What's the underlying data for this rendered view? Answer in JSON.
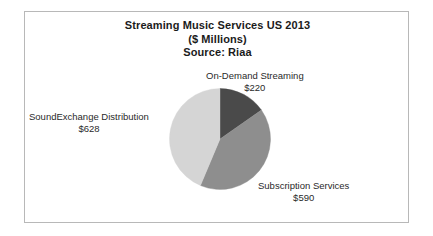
{
  "chart_data": {
    "type": "pie",
    "title": "Streaming Music Services US 2013",
    "subtitle": "($ Millions)",
    "source": "Source: Riaa",
    "unit": "$ Millions",
    "categories": [
      "On-Demand Streaming",
      "Subscription Services",
      "SoundExchange Distribution"
    ],
    "values": [
      220,
      590,
      628
    ],
    "value_labels": [
      "$220",
      "$590",
      "$628"
    ],
    "total": 1438,
    "start_angle_deg": 0,
    "direction": "clockwise",
    "legend": "none",
    "labels_position": "outside-callout",
    "grid": false,
    "slices": [
      {
        "name": "On-Demand Streaming",
        "value": 220,
        "value_label": "$220",
        "percent": 15.3,
        "color": "#4a4a4a",
        "start_angle_deg": 0,
        "end_angle_deg": 55.1
      },
      {
        "name": "Subscription Services",
        "value": 590,
        "value_label": "$590",
        "percent": 41.0,
        "color": "#8e8e8e",
        "start_angle_deg": 55.1,
        "end_angle_deg": 202.8
      },
      {
        "name": "SoundExchange Distribution",
        "value": 628,
        "value_label": "$628",
        "percent": 43.7,
        "color": "#d5d5d5",
        "start_angle_deg": 202.8,
        "end_angle_deg": 360
      }
    ]
  },
  "frame": {
    "border_color": "#b8b8b8",
    "background": "#ffffff"
  },
  "titles": {
    "line1": "Streaming Music Services US 2013",
    "line2": "($ Millions)",
    "line3": "Source: Riaa"
  },
  "callouts": {
    "ondemand": {
      "label": "On-Demand Streaming",
      "value": "$220"
    },
    "soundexchange": {
      "label": "SoundExchange Distribution",
      "value": "$628"
    },
    "subscription": {
      "label": "Subscription Services",
      "value": "$590"
    }
  }
}
